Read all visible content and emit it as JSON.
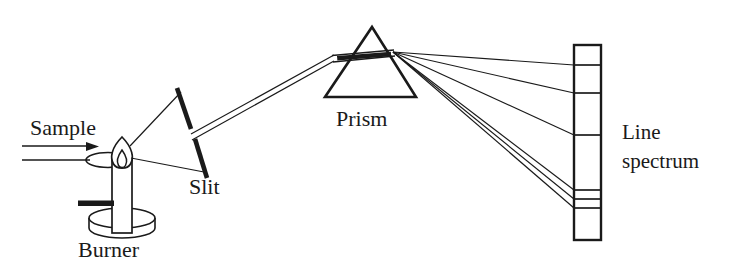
{
  "figure": {
    "background_color": "#ffffff",
    "ink_color": "#1a1a1a",
    "width": 742,
    "height": 272
  },
  "labels": {
    "sample": "Sample",
    "burner": "Burner",
    "slit": "Slit",
    "prism": "Prism",
    "line_spectrum_line1": "Line",
    "line_spectrum_line2": "spectrum"
  },
  "components": {
    "sample_inlet": {
      "name": "sample-inlet",
      "arrow_label": "Sample",
      "arrow_from_x": 22,
      "arrow_to_x": 92,
      "arrow_y": 146,
      "stem_y": 160,
      "loop_center_x": 108,
      "loop_center_y": 160,
      "loop_rx": 22,
      "loop_ry": 7
    },
    "burner": {
      "name": "burner",
      "label": "Burner",
      "tube_x": 112,
      "tube_top_y": 156,
      "tube_width": 20,
      "tube_bottom_y": 232,
      "base_center_x": 122,
      "base_top_y": 216,
      "base_rx": 33,
      "base_ry": 10,
      "base_height": 12,
      "side_arm_x1": 78,
      "side_arm_x2": 116,
      "side_arm_y": 203,
      "flame_center_x": 122,
      "flame_top_y": 137,
      "flame_bottom_y": 168
    },
    "slit": {
      "name": "slit",
      "label": "Slit",
      "bar_top_x": 177,
      "bar_top_y": 88,
      "bar_bottom_x": 207,
      "bar_bottom_y": 178,
      "gap_center_x": 193,
      "gap_center_y": 134
    },
    "prism": {
      "name": "prism",
      "label": "Prism",
      "apex_x": 372,
      "apex_y": 27,
      "base_left_x": 325,
      "base_right_x": 416,
      "base_y": 97,
      "beam_entry_x": 332,
      "beam_entry_y": 58,
      "beam_exit_x": 393,
      "beam_exit_y": 52
    },
    "screen": {
      "name": "line-spectrum-screen",
      "label_line1": "Line",
      "label_line2": "spectrum",
      "left_x": 574,
      "right_x": 601,
      "top_y": 45,
      "bottom_y": 240,
      "spectral_lines_y": [
        65,
        93,
        135,
        190,
        199,
        208
      ]
    }
  },
  "light_paths": {
    "source_rays_count": 2,
    "collimated_beam": "double-line from slit to prism",
    "dispersed_rays_count": 6,
    "dispersion_origin_x": 393,
    "dispersion_origin_y": 52
  }
}
